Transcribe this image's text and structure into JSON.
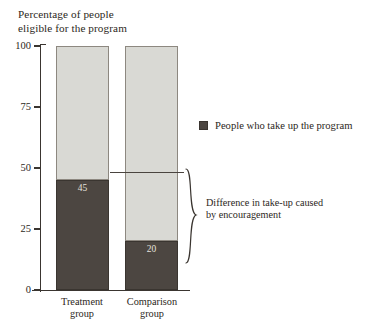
{
  "chart_data": {
    "type": "bar",
    "title": "Percentage of people eligible for the program",
    "title_lines": [
      "Percentage of people",
      "eligible for the program"
    ],
    "xlabel": "",
    "ylabel": "Percentage of people eligible for the program",
    "ylim": [
      0,
      100
    ],
    "yticks": [
      0,
      25,
      50,
      75,
      100
    ],
    "ytick_labels": [
      "0",
      "25",
      "50",
      "75",
      "100"
    ],
    "grid": false,
    "stacked": true,
    "categories": [
      "Treatment group",
      "Comparison group"
    ],
    "category_lines": [
      [
        "Treatment",
        "group"
      ],
      [
        "Comparison",
        "group"
      ]
    ],
    "series": [
      {
        "name": "People who take up the program",
        "values": [
          45,
          20
        ],
        "color": "#4c4641",
        "labels": [
          "45",
          "20"
        ]
      },
      {
        "name": "Remainder (eligible, did not take up)",
        "values": [
          55,
          80
        ],
        "color": "#d9d9d4",
        "labels": [
          "",
          ""
        ]
      }
    ],
    "legend": {
      "position": "right",
      "entries": [
        {
          "label": "People who take up the program",
          "color": "#4c4641"
        }
      ]
    },
    "annotations": [
      {
        "text": "Difference in take-up caused by encouragement",
        "lines": [
          "Difference in take-up caused",
          "by encouragement"
        ],
        "from_value": 20,
        "to_value": 45,
        "marker": "curly-brace"
      }
    ],
    "colors": {
      "take_up": "#4c4641",
      "remainder": "#d9d9d4",
      "axis": "#3a3530",
      "text": "#2c2722",
      "background": "#ffffff"
    }
  }
}
